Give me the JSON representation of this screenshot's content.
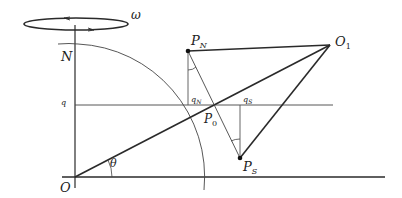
{
  "diagram": {
    "type": "geometry",
    "labels": {
      "omega": "ω",
      "N": "N",
      "O": "O",
      "q": "q",
      "PN": "P",
      "PN_sub": "N",
      "O1": "O",
      "O1_sub": "1",
      "qN": "q",
      "qN_sub": "N",
      "qS": "q",
      "qS_sub": "S",
      "P0": "P",
      "P0_sub": "0",
      "theta": "θ",
      "PS": "P",
      "PS_sub": "S"
    },
    "points": {
      "O": [
        75,
        177
      ],
      "N": [
        75,
        44
      ],
      "P_N": [
        188,
        51
      ],
      "O_1": [
        330,
        45
      ],
      "P_0": [
        213,
        105
      ],
      "P_S": [
        240,
        158
      ]
    },
    "colors": {
      "line": "#2a2a2a",
      "thin": "#555555"
    }
  }
}
